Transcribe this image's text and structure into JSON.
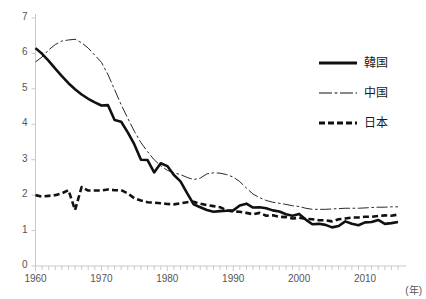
{
  "chart_data": {
    "type": "line",
    "title": "",
    "xlabel": "(年)",
    "ylabel": "",
    "xlim": [
      1960,
      2015
    ],
    "ylim": [
      0,
      7
    ],
    "yticks": [
      0,
      1,
      2,
      3,
      4,
      5,
      6,
      7
    ],
    "xticks": [
      1960,
      1970,
      1980,
      1990,
      2000,
      2010
    ],
    "xtick_labels": [
      "1960",
      "1970",
      "1980",
      "1990",
      "2000",
      "2010"
    ],
    "ytick_labels": [
      "0",
      "1",
      "2",
      "3",
      "4",
      "5",
      "6",
      "7"
    ],
    "minor_x_tick_interval": 1,
    "grid": false,
    "legend_position": "upper-right",
    "x": [
      1960,
      1961,
      1962,
      1963,
      1964,
      1965,
      1966,
      1967,
      1968,
      1969,
      1970,
      1971,
      1972,
      1973,
      1974,
      1975,
      1976,
      1977,
      1978,
      1979,
      1980,
      1981,
      1982,
      1983,
      1984,
      1985,
      1986,
      1987,
      1988,
      1989,
      1990,
      1991,
      1992,
      1993,
      1994,
      1995,
      1996,
      1997,
      1998,
      1999,
      2000,
      2001,
      2002,
      2003,
      2004,
      2005,
      2006,
      2007,
      2008,
      2009,
      2010,
      2011,
      2012,
      2013,
      2014,
      2015
    ],
    "series": [
      {
        "name": "韓国",
        "style": "solid",
        "color": "#111111",
        "width": 2.6,
        "values": [
          6.15,
          5.99,
          5.79,
          5.57,
          5.36,
          5.16,
          4.99,
          4.84,
          4.72,
          4.62,
          4.53,
          4.54,
          4.12,
          4.07,
          3.77,
          3.43,
          3.0,
          2.99,
          2.64,
          2.9,
          2.82,
          2.57,
          2.39,
          2.06,
          1.74,
          1.66,
          1.58,
          1.53,
          1.55,
          1.56,
          1.57,
          1.71,
          1.76,
          1.65,
          1.66,
          1.63,
          1.57,
          1.54,
          1.46,
          1.42,
          1.47,
          1.31,
          1.18,
          1.19,
          1.16,
          1.09,
          1.13,
          1.26,
          1.19,
          1.15,
          1.23,
          1.24,
          1.3,
          1.19,
          1.21,
          1.24
        ]
      },
      {
        "name": "中国",
        "style": "dashdot",
        "color": "#111111",
        "width": 0.9,
        "values": [
          5.76,
          5.9,
          6.1,
          6.25,
          6.35,
          6.38,
          6.4,
          6.3,
          6.15,
          5.95,
          5.75,
          5.4,
          4.98,
          4.55,
          4.17,
          3.8,
          3.48,
          3.23,
          3.0,
          2.83,
          2.7,
          2.63,
          2.58,
          2.5,
          2.44,
          2.48,
          2.6,
          2.63,
          2.62,
          2.58,
          2.51,
          2.38,
          2.2,
          2.03,
          1.93,
          1.85,
          1.8,
          1.77,
          1.74,
          1.7,
          1.68,
          1.63,
          1.6,
          1.6,
          1.6,
          1.61,
          1.62,
          1.63,
          1.63,
          1.63,
          1.64,
          1.65,
          1.66,
          1.66,
          1.67,
          1.67
        ]
      },
      {
        "name": "日本",
        "style": "dashed",
        "color": "#111111",
        "width": 2.6,
        "values": [
          2.0,
          1.96,
          1.98,
          2.0,
          2.05,
          2.14,
          1.58,
          2.23,
          2.13,
          2.13,
          2.13,
          2.16,
          2.14,
          2.14,
          2.05,
          1.91,
          1.85,
          1.8,
          1.79,
          1.77,
          1.75,
          1.74,
          1.77,
          1.8,
          1.81,
          1.76,
          1.72,
          1.69,
          1.66,
          1.57,
          1.54,
          1.53,
          1.5,
          1.46,
          1.5,
          1.42,
          1.43,
          1.39,
          1.38,
          1.34,
          1.36,
          1.33,
          1.32,
          1.29,
          1.29,
          1.26,
          1.32,
          1.34,
          1.37,
          1.37,
          1.39,
          1.39,
          1.41,
          1.43,
          1.42,
          1.45
        ]
      }
    ]
  },
  "axis": {
    "unit_label": "(年)"
  },
  "legend": {
    "items": [
      {
        "label": "韓国",
        "style": "solid"
      },
      {
        "label": "中国",
        "style": "dashdot"
      },
      {
        "label": "日本",
        "style": "dashed"
      }
    ]
  }
}
